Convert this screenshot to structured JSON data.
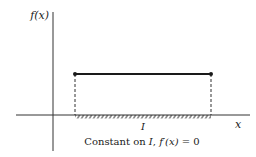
{
  "diagram": {
    "y_axis_label": "f(x)",
    "x_axis_label": "x",
    "interval_label": "I",
    "caption": {
      "prefix": "Constant on ",
      "interval": "I",
      "separator": ", ",
      "derivative": "f′(x)",
      "equals": " = 0"
    },
    "colors": {
      "ink": "#1a1a1a",
      "axis": "#333333"
    }
  }
}
